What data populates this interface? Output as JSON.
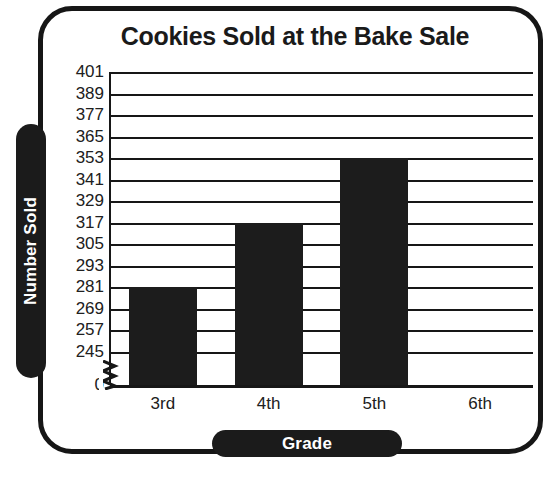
{
  "frame": {
    "style": "rounded-black-border"
  },
  "chart_data": {
    "type": "bar",
    "title": "Cookies Sold at the Bake Sale",
    "xlabel": "Grade",
    "ylabel": "Number Sold",
    "categories": [
      "3rd",
      "4th",
      "5th",
      "6th"
    ],
    "values": [
      281,
      317,
      353,
      0
    ],
    "ytick_labels": [
      "401",
      "389",
      "377",
      "365",
      "353",
      "341",
      "329",
      "317",
      "305",
      "293",
      "281",
      "269",
      "257",
      "245",
      "0"
    ],
    "ytick_values": [
      401,
      389,
      377,
      365,
      353,
      341,
      329,
      317,
      305,
      293,
      281,
      269,
      257,
      245,
      0
    ],
    "ylim": [
      245,
      401
    ],
    "y_increment": 12,
    "axis_break": true,
    "axis_break_between": [
      0,
      245
    ],
    "grid": true,
    "grid_orientation": "horizontal",
    "legend": null,
    "bar_color": "#1c1c1c",
    "background_color": "#ffffff",
    "text_color": "#1a1a1a"
  }
}
